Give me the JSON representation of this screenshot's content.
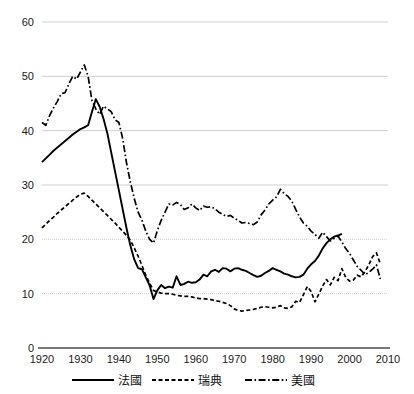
{
  "chart_data": {
    "type": "line",
    "title": "",
    "subtitle": "",
    "xlabel": "",
    "ylabel": "",
    "xlim": [
      1920,
      2010
    ],
    "ylim": [
      0,
      60
    ],
    "grid": true,
    "grid_axis": "y",
    "legend_position": "bottom",
    "y_ticks": [
      0,
      10,
      20,
      30,
      40,
      50,
      60
    ],
    "x_ticks": [
      1920,
      1930,
      1940,
      1950,
      1960,
      1970,
      1980,
      1990,
      2000,
      2010
    ],
    "y_tick_labels": [
      "0",
      "10",
      "20",
      "30",
      "40",
      "50",
      "60"
    ],
    "x_tick_labels": [
      "1920",
      "1930",
      "1940",
      "1950",
      "1960",
      "1970",
      "1980",
      "1990",
      "2000",
      "2010"
    ],
    "series": [
      {
        "name": "法國",
        "style": "solid",
        "color": "#000000",
        "x": [
          1920,
          1921,
          1922,
          1923,
          1924,
          1925,
          1926,
          1927,
          1928,
          1929,
          1930,
          1931,
          1932,
          1933,
          1934,
          1935,
          1936,
          1937,
          1938,
          1939,
          1940,
          1941,
          1942,
          1943,
          1944,
          1945,
          1946,
          1947,
          1948,
          1949,
          1950,
          1951,
          1952,
          1953,
          1954,
          1955,
          1956,
          1957,
          1958,
          1959,
          1960,
          1961,
          1962,
          1963,
          1964,
          1965,
          1966,
          1967,
          1968,
          1969,
          1970,
          1971,
          1972,
          1973,
          1974,
          1975,
          1976,
          1977,
          1978,
          1979,
          1980,
          1981,
          1982,
          1983,
          1984,
          1985,
          1986,
          1987,
          1988,
          1989,
          1990,
          1991,
          1992,
          1993,
          1994,
          1995,
          1996,
          1997,
          1998
        ],
        "values": [
          34.2,
          34.9,
          35.6,
          36.3,
          36.9,
          37.5,
          38.1,
          38.7,
          39.3,
          39.8,
          40.3,
          40.6,
          41.0,
          43.5,
          45.8,
          44.4,
          42.2,
          39.5,
          36.0,
          32.5,
          29.0,
          25.5,
          22.0,
          18.8,
          16.3,
          14.7,
          14.5,
          13.0,
          11.5,
          9.0,
          10.6,
          11.6,
          11.0,
          11.3,
          11.1,
          13.2,
          11.6,
          11.8,
          12.2,
          12.0,
          12.1,
          12.6,
          13.5,
          13.2,
          14.1,
          14.4,
          14.0,
          14.7,
          14.6,
          14.1,
          14.6,
          14.7,
          14.4,
          14.2,
          13.8,
          13.4,
          13.1,
          13.3,
          13.8,
          14.2,
          14.7,
          14.4,
          14.1,
          13.7,
          13.5,
          13.2,
          13.0,
          13.1,
          13.5,
          14.6,
          15.4,
          16.0,
          17.0,
          18.3,
          19.3,
          20.0,
          20.5,
          20.7,
          21.0
        ]
      },
      {
        "name": "瑞典",
        "style": "dotted",
        "color": "#000000",
        "x": [
          1920,
          1921,
          1922,
          1923,
          1924,
          1925,
          1926,
          1927,
          1928,
          1929,
          1930,
          1931,
          1932,
          1933,
          1934,
          1935,
          1936,
          1937,
          1938,
          1939,
          1940,
          1941,
          1942,
          1943,
          1944,
          1945,
          1946,
          1947,
          1948,
          1949,
          1950,
          1951,
          1952,
          1953,
          1954,
          1955,
          1956,
          1957,
          1958,
          1959,
          1960,
          1961,
          1962,
          1963,
          1964,
          1965,
          1966,
          1967,
          1968,
          1969,
          1970,
          1971,
          1972,
          1973,
          1974,
          1975,
          1976,
          1977,
          1978,
          1979,
          1980,
          1981,
          1982,
          1983,
          1984,
          1985,
          1986,
          1987,
          1988,
          1989,
          1990,
          1991,
          1992,
          1993,
          1994,
          1995,
          1996,
          1997,
          1998,
          1999,
          2000,
          2001,
          2002,
          2003,
          2004,
          2005,
          2006,
          2007,
          2008
        ],
        "values": [
          22.1,
          22.8,
          23.5,
          24.1,
          24.8,
          25.4,
          26.0,
          26.6,
          27.2,
          27.8,
          28.3,
          28.5,
          27.9,
          27.2,
          26.5,
          25.8,
          25.1,
          24.4,
          23.7,
          23.0,
          22.2,
          21.5,
          20.7,
          19.8,
          18.4,
          16.9,
          15.2,
          13.4,
          11.9,
          10.6,
          10.3,
          10.1,
          10.0,
          10.0,
          9.9,
          9.7,
          9.6,
          9.5,
          9.5,
          9.4,
          9.2,
          9.1,
          9.1,
          9.0,
          8.9,
          8.7,
          8.6,
          8.4,
          8.2,
          7.8,
          7.2,
          6.9,
          6.8,
          6.9,
          7.0,
          7.1,
          7.3,
          7.5,
          7.6,
          7.5,
          7.4,
          7.5,
          7.8,
          7.4,
          7.3,
          7.6,
          8.6,
          8.4,
          9.8,
          11.3,
          10.4,
          8.5,
          9.9,
          11.4,
          12.6,
          11.6,
          13.0,
          12.4,
          14.6,
          13.0,
          12.3,
          12.5,
          13.4,
          13.1,
          14.0,
          15.3,
          16.8,
          17.5,
          15.5
        ]
      },
      {
        "name": "美國",
        "style": "dashdot",
        "color": "#000000",
        "x": [
          1920,
          1921,
          1922,
          1923,
          1924,
          1925,
          1926,
          1927,
          1928,
          1929,
          1930,
          1931,
          1932,
          1933,
          1934,
          1935,
          1936,
          1937,
          1938,
          1939,
          1940,
          1941,
          1942,
          1943,
          1944,
          1945,
          1946,
          1947,
          1948,
          1949,
          1950,
          1951,
          1952,
          1953,
          1954,
          1955,
          1956,
          1957,
          1958,
          1959,
          1960,
          1961,
          1962,
          1963,
          1964,
          1965,
          1966,
          1967,
          1968,
          1969,
          1970,
          1971,
          1972,
          1973,
          1974,
          1975,
          1976,
          1977,
          1978,
          1979,
          1980,
          1981,
          1982,
          1983,
          1984,
          1985,
          1986,
          1987,
          1988,
          1989,
          1990,
          1991,
          1992,
          1993,
          1994,
          1995,
          1996,
          1997,
          1998,
          1999,
          2000,
          2001,
          2002,
          2003,
          2004,
          2005,
          2006,
          2007,
          2008
        ],
        "values": [
          41.5,
          41.0,
          42.8,
          44.2,
          45.4,
          46.8,
          47.0,
          48.6,
          50.0,
          49.5,
          50.8,
          52.1,
          50.0,
          45.5,
          44.0,
          43.0,
          44.5,
          44.0,
          43.5,
          42.0,
          41.5,
          38.5,
          34.0,
          30.5,
          27.5,
          25.0,
          23.5,
          21.5,
          20.0,
          19.3,
          21.6,
          23.5,
          25.0,
          26.5,
          26.3,
          26.8,
          26.4,
          25.5,
          25.8,
          26.5,
          25.8,
          25.3,
          26.1,
          25.9,
          26.0,
          25.6,
          25.0,
          24.6,
          24.2,
          24.4,
          23.9,
          23.5,
          23.0,
          23.1,
          22.9,
          22.7,
          23.2,
          24.5,
          25.4,
          26.5,
          27.2,
          27.8,
          29.2,
          28.4,
          27.9,
          27.0,
          25.5,
          24.1,
          23.0,
          22.4,
          21.5,
          20.9,
          20.2,
          21.3,
          20.5,
          19.7,
          20.2,
          20.6,
          19.5,
          18.3,
          17.4,
          16.2,
          15.0,
          14.3,
          13.5,
          13.9,
          14.5,
          15.3,
          12.7
        ]
      }
    ]
  },
  "legend": {
    "items": [
      {
        "label": "法國",
        "style": "solid"
      },
      {
        "label": "瑞典",
        "style": "dotted"
      },
      {
        "label": "美國",
        "style": "dashdot"
      }
    ]
  }
}
